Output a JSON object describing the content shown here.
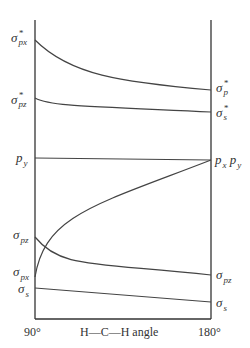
{
  "diagram": {
    "type": "walsh-diagram",
    "x_axis": {
      "left_label": "90°",
      "right_label": "180°",
      "title": "H—C—H angle"
    },
    "left_labels": [
      {
        "base": "σ",
        "sup": "*",
        "sub": "px",
        "y": 40
      },
      {
        "base": "σ",
        "sup": "*",
        "sub": "pz",
        "y": 100
      },
      {
        "base": "p",
        "sup": "",
        "sub": "y",
        "y": 158
      },
      {
        "base": "σ",
        "sup": "",
        "sub": "pz",
        "y": 237
      },
      {
        "base": "σ",
        "sup": "",
        "sub": "px",
        "y": 277
      },
      {
        "base": "σ",
        "sup": "",
        "sub": "s",
        "y": 289
      }
    ],
    "right_labels": [
      {
        "base": "σ",
        "sup": "*",
        "sub": "p",
        "y": 90
      },
      {
        "base": "σ",
        "sup": "*",
        "sub": "s",
        "y": 112
      },
      {
        "text": "px py",
        "y": 160
      },
      {
        "base": "σ",
        "sup": "",
        "sub": "pz",
        "y": 275
      },
      {
        "base": "σ",
        "sup": "",
        "sub": "s",
        "y": 302
      }
    ],
    "label_text": {
      "l0_base": "σ",
      "l0_sup": "*",
      "l0_sub": "px",
      "l1_base": "σ",
      "l1_sup": "*",
      "l1_sub": "pz",
      "l2_base": "p",
      "l2_sub": "y",
      "l3_base": "σ",
      "l3_sub": "pz",
      "l4_base": "σ",
      "l4_sub": "px",
      "l5_base": "σ",
      "l5_sub": "s",
      "r0_base": "σ",
      "r0_sup": "*",
      "r0_sub": "p",
      "r1_base": "σ",
      "r1_sup": "*",
      "r1_sub": "s",
      "r2_p1": "p",
      "r2_s1": "x",
      "r2_p2": "p",
      "r2_s2": "y",
      "r3_base": "σ",
      "r3_sub": "pz",
      "r4_base": "σ",
      "r4_sub": "s"
    },
    "curves": [
      {
        "name": "sigma-star-px-to-sigma-star-p",
        "from_y": 40,
        "to_y": 90,
        "shape": "decaying-curve"
      },
      {
        "name": "sigma-star-pz-to-sigma-star-s",
        "from_y": 100,
        "to_y": 112,
        "shape": "slight-curve"
      },
      {
        "name": "py-to-py",
        "from_y": 158,
        "to_y": 160,
        "shape": "straight"
      },
      {
        "name": "sigma-pz-to-sigma-pz",
        "from_y": 237,
        "to_y": 275,
        "shape": "decaying-curve"
      },
      {
        "name": "sigma-px-to-px",
        "from_y": 277,
        "to_y": 160,
        "shape": "rising-curve"
      },
      {
        "name": "sigma-s-to-sigma-s",
        "from_y": 289,
        "to_y": 302,
        "shape": "straight"
      }
    ],
    "line_color": "#444444"
  }
}
